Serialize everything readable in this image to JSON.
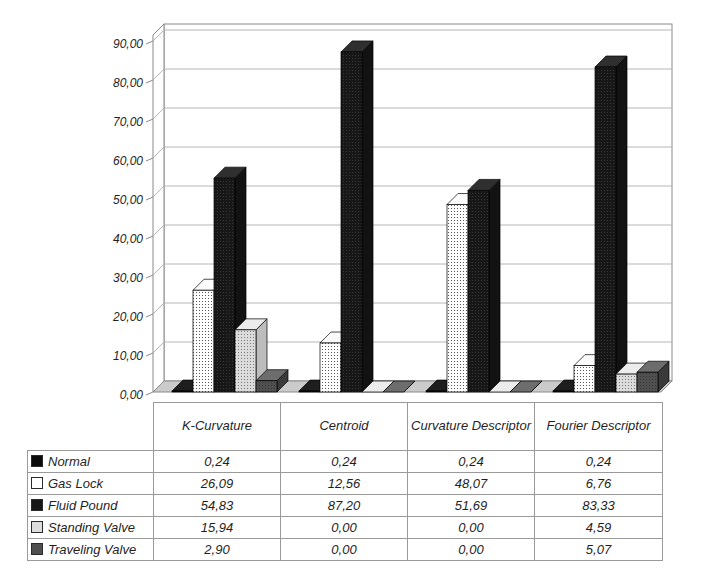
{
  "chart": {
    "y_axis": {
      "ticks": [
        "0,00",
        "10,00",
        "20,00",
        "30,00",
        "40,00",
        "50,00",
        "60,00",
        "70,00",
        "80,00",
        "90,00"
      ],
      "min": 0,
      "max": 90,
      "step": 10
    },
    "colors": {
      "background": "#ffffff",
      "wall": "#ffffff",
      "floor": "#cbcbcb",
      "gridline": "#aeaeae",
      "axis": "#8a8a8a",
      "text": "#1f1f1f",
      "table_border": "#9a9a9a",
      "normal": "#0b0b0b",
      "gas_lock_bg": "#ffffff",
      "gas_lock_dot": "#3a3a3a",
      "fluid_pound_bg": "#171717",
      "fluid_pound_dot": "#3c3c3c",
      "standing_bg": "#dcdcdc",
      "standing_dot": "#6a6a6a",
      "traveling": "#4f4f4f",
      "traveling_dot": "#333333"
    }
  },
  "chart_data": {
    "type": "bar",
    "style": "3d-clustered-column",
    "title": "",
    "xlabel": "",
    "ylabel": "",
    "ylim": [
      0,
      90
    ],
    "grid": true,
    "legend_position": "data-table-left",
    "categories": [
      "K-Curvature",
      "Centroid",
      "Curvature Descriptor",
      "Fourier Descriptor"
    ],
    "series": [
      {
        "name": "Normal",
        "values": [
          0.24,
          0.24,
          0.24,
          0.24
        ]
      },
      {
        "name": "Gas Lock",
        "values": [
          26.09,
          12.56,
          48.07,
          6.76
        ]
      },
      {
        "name": "Fluid Pound",
        "values": [
          54.83,
          87.2,
          51.69,
          83.33
        ]
      },
      {
        "name": "Standing Valve",
        "values": [
          15.94,
          0.0,
          0.0,
          4.59
        ]
      },
      {
        "name": "Traveling Valve",
        "values": [
          2.9,
          0.0,
          0.0,
          5.07
        ]
      }
    ]
  },
  "table": {
    "columns": [
      "K-Curvature",
      "Centroid",
      "Curvature Descriptor",
      "Fourier Descriptor"
    ],
    "rows": [
      {
        "key": "normal",
        "label": "Normal",
        "values": [
          "0,24",
          "0,24",
          "0,24",
          "0,24"
        ]
      },
      {
        "key": "gas_lock",
        "label": "Gas Lock",
        "values": [
          "26,09",
          "12,56",
          "48,07",
          "6,76"
        ]
      },
      {
        "key": "fluid_pound",
        "label": "Fluid Pound",
        "values": [
          "54,83",
          "87,20",
          "51,69",
          "83,33"
        ]
      },
      {
        "key": "standing_valve",
        "label": "Standing Valve",
        "values": [
          "15,94",
          "0,00",
          "0,00",
          "4,59"
        ]
      },
      {
        "key": "traveling_valve",
        "label": "Traveling Valve",
        "values": [
          "2,90",
          "0,00",
          "0,00",
          "5,07"
        ]
      }
    ]
  }
}
